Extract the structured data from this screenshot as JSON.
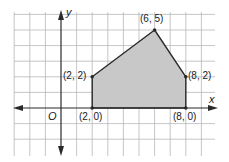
{
  "diagram": {
    "type": "coordinate-plane-polygon",
    "axes": {
      "x_label": "x",
      "y_label": "y",
      "origin_label": "O"
    },
    "grid": {
      "x_min": -3,
      "x_max": 9,
      "y_min": -2,
      "y_max": 6,
      "step": 1
    },
    "polygon": {
      "fill": "#c8c8c8",
      "stroke": "#2a2a2a",
      "vertices": [
        {
          "x": 2,
          "y": 0,
          "label": "(2, 0)"
        },
        {
          "x": 2,
          "y": 2,
          "label": "(2, 2)"
        },
        {
          "x": 6,
          "y": 5,
          "label": "(6, 5)"
        },
        {
          "x": 8,
          "y": 2,
          "label": "(8, 2)"
        },
        {
          "x": 8,
          "y": 0,
          "label": "(8, 0)"
        }
      ]
    },
    "colors": {
      "grid": "#b8b8b8",
      "axis": "#2a2a2a",
      "background": "#ffffff"
    }
  }
}
